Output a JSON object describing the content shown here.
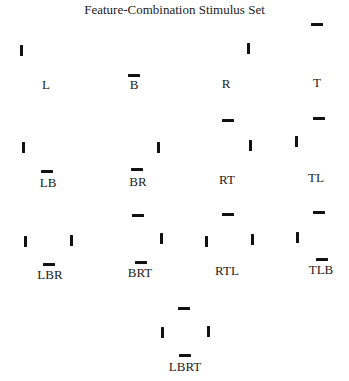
{
  "figure": {
    "title": "Feature-Combination Stimulus Set",
    "stimuli": [
      {
        "label": "L",
        "label_pos": [
          46,
          77
        ],
        "bars": [
          {
            "type": "v",
            "x": 20,
            "y": 45
          }
        ]
      },
      {
        "label": "B",
        "label_pos": [
          134,
          77
        ],
        "bars": [
          {
            "type": "h",
            "x": 128,
            "y": 74
          }
        ]
      },
      {
        "label": "R",
        "label_pos": [
          226,
          76
        ],
        "bars": [
          {
            "type": "v",
            "x": 247,
            "y": 43
          }
        ]
      },
      {
        "label": "T",
        "label_pos": [
          317,
          75
        ],
        "bars": [
          {
            "type": "h",
            "x": 311,
            "y": 23
          }
        ]
      },
      {
        "label": "LB",
        "label_pos": [
          48,
          175
        ],
        "bars": [
          {
            "type": "v",
            "x": 22,
            "y": 142
          },
          {
            "type": "h",
            "x": 41,
            "y": 170
          }
        ]
      },
      {
        "label": "BR",
        "label_pos": [
          138,
          174
        ],
        "bars": [
          {
            "type": "v",
            "x": 157,
            "y": 142
          },
          {
            "type": "h",
            "x": 131,
            "y": 168
          }
        ]
      },
      {
        "label": "RT",
        "label_pos": [
          227,
          172
        ],
        "bars": [
          {
            "type": "h",
            "x": 222,
            "y": 119
          },
          {
            "type": "v",
            "x": 249,
            "y": 140
          }
        ]
      },
      {
        "label": "TL",
        "label_pos": [
          316,
          170
        ],
        "bars": [
          {
            "type": "h",
            "x": 313,
            "y": 117
          },
          {
            "type": "v",
            "x": 295,
            "y": 136
          }
        ]
      },
      {
        "label": "LBR",
        "label_pos": [
          50,
          267
        ],
        "bars": [
          {
            "type": "v",
            "x": 24,
            "y": 236
          },
          {
            "type": "v",
            "x": 70,
            "y": 235
          },
          {
            "type": "h",
            "x": 43,
            "y": 263
          }
        ]
      },
      {
        "label": "BRT",
        "label_pos": [
          140,
          265
        ],
        "bars": [
          {
            "type": "h",
            "x": 132,
            "y": 214
          },
          {
            "type": "v",
            "x": 160,
            "y": 233
          },
          {
            "type": "h",
            "x": 135,
            "y": 261
          }
        ]
      },
      {
        "label": "RTL",
        "label_pos": [
          227,
          263
        ],
        "bars": [
          {
            "type": "h",
            "x": 222,
            "y": 213
          },
          {
            "type": "v",
            "x": 205,
            "y": 236
          },
          {
            "type": "v",
            "x": 251,
            "y": 234
          }
        ]
      },
      {
        "label": "TLB",
        "label_pos": [
          321,
          262
        ],
        "bars": [
          {
            "type": "h",
            "x": 313,
            "y": 211
          },
          {
            "type": "v",
            "x": 296,
            "y": 232
          },
          {
            "type": "h",
            "x": 316,
            "y": 258
          }
        ]
      },
      {
        "label": "LBRT",
        "label_pos": [
          185,
          359
        ],
        "bars": [
          {
            "type": "h",
            "x": 178,
            "y": 307
          },
          {
            "type": "v",
            "x": 161,
            "y": 327
          },
          {
            "type": "v",
            "x": 207,
            "y": 326
          },
          {
            "type": "h",
            "x": 179,
            "y": 354
          }
        ]
      }
    ]
  }
}
